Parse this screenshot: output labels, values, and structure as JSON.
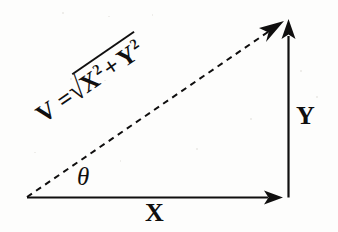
{
  "figure": {
    "kind": "vector-decomposition-right-triangle",
    "background_color": "#fdfdfc",
    "ink_color": "#100f0f",
    "labels": {
      "x_component": "X",
      "y_component": "Y",
      "angle": "θ",
      "magnitude_lhs": "V =",
      "radical_sign": "√",
      "radicand_first_base": "X",
      "radicand_first_exponent": "2",
      "radicand_operator": "+",
      "radicand_second_base": "Y",
      "radicand_second_exponent": "2",
      "magnitude_full": "V = √(X² + Y²)"
    },
    "geometry": {
      "origin": [
        27,
        197
      ],
      "x_axis_end": [
        283,
        197
      ],
      "y_axis_top": [
        288,
        22
      ],
      "y_axis_base": [
        288,
        197
      ],
      "hypotenuse_end": [
        283,
        22
      ],
      "hypotenuse_style": "dashed",
      "hypotenuse_angle_degrees": -34.5,
      "arrowheads": [
        "x-axis-tip",
        "y-axis-tip",
        "hypotenuse-tip"
      ]
    }
  }
}
